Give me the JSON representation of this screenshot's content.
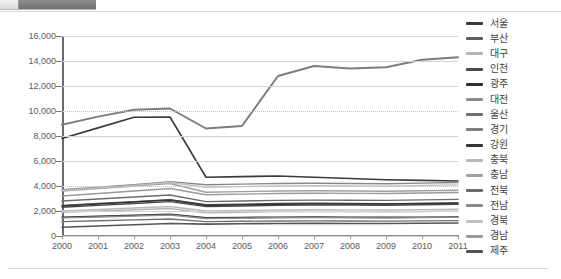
{
  "toolbar": {
    "fragment_label": ""
  },
  "chart_data": {
    "type": "line",
    "title": "",
    "xlabel": "",
    "ylabel": "",
    "x": [
      2000,
      2001,
      2002,
      2003,
      2004,
      2005,
      2006,
      2007,
      2008,
      2009,
      2010,
      2011
    ],
    "xtick_labels": [
      "2000",
      "2001",
      "2002",
      "2003",
      "2004",
      "2005",
      "2006",
      "2007",
      "2008",
      "2009",
      "2010",
      "2011"
    ],
    "ylim": [
      0,
      16000
    ],
    "yticks": [
      0,
      2000,
      4000,
      6000,
      8000,
      10000,
      12000,
      14000,
      16000
    ],
    "ytick_labels": [
      "0",
      "2,000",
      "4,000",
      "6,000",
      "8,000",
      "10,000",
      "12,000",
      "14,000",
      "16,000"
    ],
    "grid": true,
    "legend_position": "right",
    "series": [
      {
        "name": "서울",
        "color": "#3a3a3a",
        "width": 1.6,
        "values": [
          7800,
          8650,
          9500,
          9520,
          4700,
          4750,
          4800,
          4700,
          4600,
          4500,
          4450,
          4400
        ]
      },
      {
        "name": "부산",
        "color": "#5d5d5d",
        "width": 1.4,
        "values": [
          2450,
          2600,
          2750,
          2900,
          2500,
          2550,
          2600,
          2620,
          2600,
          2580,
          2600,
          2620
        ]
      },
      {
        "name": "대구",
        "color": "#b4b4b4",
        "width": 1.4,
        "values": [
          1900,
          2000,
          2100,
          2200,
          1850,
          1900,
          1950,
          1960,
          1950,
          1940,
          1960,
          1980
        ]
      },
      {
        "name": "인천",
        "color": "#4a4a4a",
        "width": 1.4,
        "values": [
          2300,
          2450,
          2600,
          2750,
          2350,
          2400,
          2450,
          2480,
          2470,
          2460,
          2500,
          2540
        ]
      },
      {
        "name": "광주",
        "color": "#2e2e2e",
        "width": 1.6,
        "values": [
          1500,
          1580,
          1660,
          1740,
          1450,
          1480,
          1500,
          1510,
          1500,
          1490,
          1500,
          1520
        ]
      },
      {
        "name": "대전",
        "color": "#8c8c8c",
        "width": 1.4,
        "values": [
          1450,
          1520,
          1600,
          1680,
          1400,
          1430,
          1460,
          1470,
          1460,
          1450,
          1470,
          1490
        ]
      },
      {
        "name": "울산",
        "color": "#707070",
        "width": 1.4,
        "values": [
          1150,
          1220,
          1290,
          1360,
          1150,
          1180,
          1200,
          1210,
          1200,
          1190,
          1210,
          1230
        ]
      },
      {
        "name": "경기",
        "color": "#7d7d7d",
        "width": 2.0,
        "values": [
          8900,
          9550,
          10100,
          10200,
          8600,
          8800,
          12800,
          13600,
          13400,
          13500,
          14100,
          14300
        ]
      },
      {
        "name": "강원",
        "color": "#343434",
        "width": 1.6,
        "values": [
          2400,
          2560,
          2720,
          2880,
          2450,
          2500,
          2550,
          2580,
          2570,
          2560,
          2600,
          2640
        ]
      },
      {
        "name": "충북",
        "color": "#b9b9b9",
        "width": 1.4,
        "values": [
          2000,
          2120,
          2240,
          2360,
          2000,
          2040,
          2080,
          2100,
          2090,
          2080,
          2110,
          2140
        ]
      },
      {
        "name": "충남",
        "color": "#a0a0a0",
        "width": 1.4,
        "values": [
          3600,
          3800,
          4000,
          4200,
          3500,
          3550,
          3600,
          3620,
          3600,
          3580,
          3620,
          3660
        ]
      },
      {
        "name": "전북",
        "color": "#6b6b6b",
        "width": 1.4,
        "values": [
          2800,
          2960,
          3120,
          3280,
          2750,
          2800,
          2850,
          2870,
          2860,
          2850,
          2890,
          2930
        ]
      },
      {
        "name": "전남",
        "color": "#888888",
        "width": 1.4,
        "values": [
          3700,
          3900,
          4100,
          4350,
          4100,
          4150,
          4200,
          4220,
          4200,
          4180,
          4230,
          4280
        ]
      },
      {
        "name": "경북",
        "color": "#c0c0c0",
        "width": 1.4,
        "values": [
          3650,
          3850,
          4050,
          4280,
          3900,
          3950,
          4000,
          4020,
          4000,
          3990,
          4040,
          4090
        ]
      },
      {
        "name": "경남",
        "color": "#9a9a9a",
        "width": 1.4,
        "values": [
          3200,
          3400,
          3600,
          3800,
          3300,
          3350,
          3400,
          3420,
          3410,
          3400,
          3440,
          3480
        ]
      },
      {
        "name": "제주",
        "color": "#555555",
        "width": 1.6,
        "values": [
          700,
          800,
          900,
          1000,
          950,
          980,
          1000,
          1010,
          1000,
          1000,
          1020,
          1040
        ]
      }
    ]
  }
}
